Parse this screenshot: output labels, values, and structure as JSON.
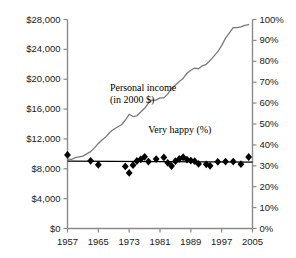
{
  "chart_data": {
    "type": "line",
    "title": "",
    "subtitle": "",
    "xlabel": "",
    "ylabel": "",
    "xlim": [
      1957,
      2005
    ],
    "xticks": [
      1957,
      1965,
      1973,
      1981,
      1989,
      1997,
      2005
    ],
    "xticklabels": [
      "1957",
      "1965",
      "1973",
      "1981",
      "1989",
      "1997",
      "2005"
    ],
    "grid": false,
    "legend": "none",
    "annotations": [
      {
        "name": "personal-income-annotation",
        "text_line1": "Personal income",
        "text_line2": "(in 2000 $)",
        "x": 1968,
        "y": 18500
      },
      {
        "name": "very-happy-annotation",
        "text": "Very happy (%)",
        "x": 1987,
        "y": 13200
      }
    ],
    "axes": {
      "left": {
        "name": "personal-income-axis",
        "ylim": [
          0,
          28000
        ],
        "yticks": [
          0,
          4000,
          8000,
          12000,
          16000,
          20000,
          24000,
          28000
        ],
        "yticklabels": [
          "$0",
          "$4,000",
          "$8,000",
          "$12,000",
          "$16,000",
          "$20,000",
          "$24,000",
          "$28,000"
        ],
        "unit": "2000 dollars"
      },
      "right": {
        "name": "very-happy-percent-axis",
        "ylim": [
          0,
          100
        ],
        "yticks": [
          0,
          10,
          20,
          30,
          40,
          50,
          60,
          70,
          80,
          90,
          100
        ],
        "yticklabels": [
          "0%",
          "10%",
          "20%",
          "30%",
          "40%",
          "50%",
          "60%",
          "70%",
          "80%",
          "90%",
          "100%"
        ],
        "unit": "percent"
      }
    },
    "series": [
      {
        "name": "Personal income (in 2000 $)",
        "type": "line",
        "axis": "left",
        "color": "#7a7a7a",
        "x": [
          1957,
          1958,
          1959,
          1960,
          1961,
          1962,
          1963,
          1964,
          1965,
          1966,
          1967,
          1968,
          1969,
          1970,
          1971,
          1972,
          1973,
          1974,
          1975,
          1976,
          1977,
          1978,
          1979,
          1980,
          1981,
          1982,
          1983,
          1984,
          1985,
          1986,
          1987,
          1988,
          1989,
          1990,
          1991,
          1992,
          1993,
          1994,
          1995,
          1996,
          1997,
          1998,
          1999,
          2000,
          2001,
          2002,
          2003,
          2004
        ],
        "values": [
          9300,
          9250,
          9500,
          9600,
          9700,
          10000,
          10300,
          10800,
          11400,
          11900,
          12300,
          12900,
          13300,
          13600,
          13900,
          14500,
          15300,
          15000,
          15100,
          15600,
          16100,
          16800,
          17200,
          17200,
          17500,
          17500,
          18000,
          18800,
          19200,
          19700,
          20100,
          20800,
          21200,
          21500,
          21400,
          21800,
          22000,
          22500,
          23100,
          23700,
          24500,
          25500,
          26200,
          26900,
          26900,
          27000,
          27200,
          27300
        ]
      },
      {
        "name": "Very happy (%)",
        "type": "scatter",
        "axis": "right",
        "marker": "diamond",
        "color": "#000000",
        "x": [
          1957,
          1963,
          1965,
          1972,
          1973,
          1974,
          1975,
          1976,
          1977,
          1978,
          1980,
          1982,
          1983,
          1984,
          1985,
          1986,
          1987,
          1988,
          1989,
          1990,
          1991,
          1993,
          1994,
          1996,
          1998,
          2000,
          2002,
          2004
        ],
        "values": [
          35.2,
          32.4,
          30.5,
          29.7,
          26.6,
          30.3,
          32.3,
          33.1,
          34.3,
          32.0,
          33.2,
          34.0,
          31.4,
          29.9,
          32.2,
          33.3,
          34.1,
          33.0,
          32.5,
          32.2,
          30.9,
          30.7,
          30.0,
          31.9,
          32.0,
          32.0,
          30.8,
          34.2
        ]
      },
      {
        "name": "Very happy trend line",
        "type": "line",
        "axis": "right",
        "color": "#000000",
        "x": [
          1957,
          2005
        ],
        "values": [
          32.2,
          31.8
        ]
      }
    ]
  }
}
